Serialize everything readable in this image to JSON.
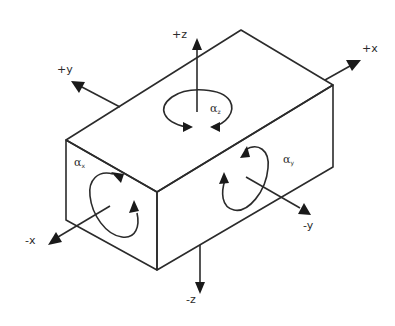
{
  "diagram": {
    "type": "isometric-box-with-axes",
    "axes": {
      "pos_x": "+x",
      "neg_x": "-x",
      "pos_y": "+y",
      "neg_y": "-y",
      "pos_z": "+z",
      "neg_z": "-z"
    },
    "rotations": {
      "alpha_z": {
        "symbol": "α",
        "sub": "z",
        "face": "top"
      },
      "alpha_x": {
        "symbol": "α",
        "sub": "x",
        "face": "front-left"
      },
      "alpha_y": {
        "symbol": "α",
        "sub": "y",
        "face": "front-right"
      }
    },
    "colors": {
      "line": "#2b2b2b",
      "background": "#ffffff"
    }
  }
}
